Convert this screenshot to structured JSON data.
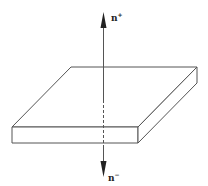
{
  "diagram": {
    "labels": {
      "top_normal": "n",
      "top_normal_sup": "+",
      "bottom_normal": "n",
      "bottom_normal_sup": "−"
    },
    "colors": {
      "stroke": "#555555",
      "background": "#ffffff",
      "arrow": "#222222"
    }
  }
}
